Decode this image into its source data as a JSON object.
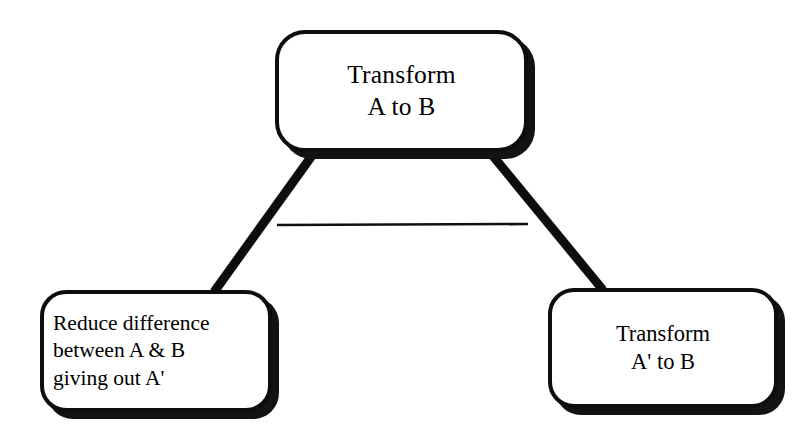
{
  "diagram": {
    "background_color": "#ffffff",
    "stroke_color": "#0d0d0d",
    "shadow_color": "#131313",
    "nodes": [
      {
        "id": "root",
        "label": "Transform\nA to B",
        "shape": "rounded-rectangle",
        "align": "center"
      },
      {
        "id": "reduce",
        "label": "Reduce difference\nbetween A & B\ngiving out A'",
        "shape": "rounded-rectangle",
        "align": "left"
      },
      {
        "id": "transform2",
        "label": "Transform\nA' to B",
        "shape": "rounded-rectangle",
        "align": "center"
      }
    ],
    "edges": [
      {
        "id": "root-to-reduce",
        "from": "root",
        "to": "reduce",
        "style": "thick-line"
      },
      {
        "id": "root-to-transform2",
        "from": "root",
        "to": "transform2",
        "style": "thick-line"
      },
      {
        "id": "crossbar",
        "from": "root-to-reduce",
        "to": "root-to-transform2",
        "style": "thin-line"
      }
    ]
  }
}
